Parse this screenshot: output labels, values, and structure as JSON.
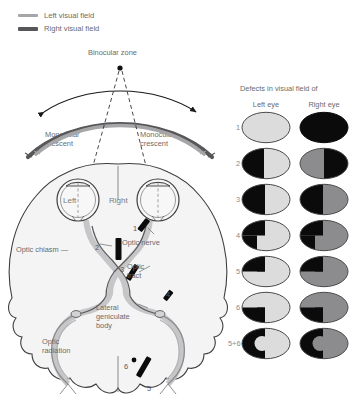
{
  "legend": {
    "items": [
      {
        "label": "Left visual field",
        "color": "#a6a6a8",
        "weight": "thin",
        "icon": "line-swatch-icon"
      },
      {
        "label": "Right visual field",
        "color": "#57575a",
        "weight": "thick",
        "icon": "line-swatch-icon"
      }
    ]
  },
  "field_diagram": {
    "binocular_zone": "Binocular zone",
    "monocular_left": "Monocular\ncrescent",
    "monocular_right": "Monocular\ncrescent",
    "left_arc_color": "#a6a6a8",
    "right_arc_color": "#57575a",
    "arrow_color": "#1a1a1a"
  },
  "brain": {
    "eye_left": "Left",
    "eye_right": "Right",
    "optic_chiasm": "Optic chiasm —",
    "optic_nerve": "Optic nerve",
    "optic_tract": "Optic\ntract",
    "lateral_geniculate": "Lateral\ngeniculate\nbody",
    "optic_radiation": "Optic\nradiation",
    "lesion_markers": [
      "1",
      "2",
      "3",
      "4",
      "5",
      "6"
    ]
  },
  "defects": {
    "title": "Defects in visual field of",
    "left_eye_header": "Left eye",
    "right_eye_header": "Right eye",
    "rows": [
      {
        "number": "1"
      },
      {
        "number": "2"
      },
      {
        "number": "3"
      },
      {
        "number": "4"
      },
      {
        "number": "5"
      },
      {
        "number": "6"
      },
      {
        "number": "5+6"
      }
    ]
  },
  "colors": {
    "light_gray": "#dcdcdc",
    "mid_gray": "#8c8c8e",
    "black": "#0b0b0b",
    "outline": "#4a4a4c",
    "brain_fill": "#f2f2f2",
    "pathway_gray": "#b9b9bb"
  }
}
